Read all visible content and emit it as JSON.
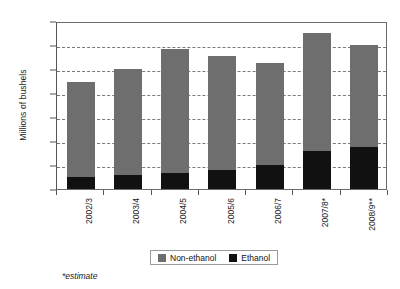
{
  "chart_data": {
    "type": "bar",
    "stacked": true,
    "title": "",
    "xlabel": "",
    "ylabel": "Millions of bushels",
    "categories": [
      "2002/3",
      "2003/4",
      "2004/5",
      "2005/6",
      "2006/7",
      "2007/8*",
      "2008/9**"
    ],
    "series": [
      {
        "name": "Non-ethanol",
        "color": "#6e6e6e",
        "values": [
          7900,
          8850,
          10400,
          9500,
          8500,
          9800,
          8500
        ]
      },
      {
        "name": "Ethanol",
        "color": "#111111",
        "values": [
          1000,
          1150,
          1300,
          1600,
          2000,
          3200,
          3500
        ]
      }
    ],
    "totals": [
      8900,
      10000,
      11700,
      11100,
      10500,
      13000,
      12000
    ],
    "ylim": [
      0,
      14000
    ],
    "ytick_values": [
      0,
      2000,
      4000,
      6000,
      8000,
      10000,
      12000,
      14000
    ],
    "ytick_labels": [
      "0",
      "2000",
      "4000",
      "6000",
      "8000",
      "10000",
      "12000",
      "14000"
    ],
    "grid": true,
    "grid_style": "dashed-horizontal",
    "legend_position": "bottom-center",
    "footnote": "*estimate"
  },
  "legend": {
    "entries": [
      {
        "label": "Non-ethanol",
        "color": "#6e6e6e",
        "swatch_name": "legend-swatch-non-ethanol"
      },
      {
        "label": "Ethanol",
        "color": "#111111",
        "swatch_name": "legend-swatch-ethanol"
      }
    ]
  }
}
